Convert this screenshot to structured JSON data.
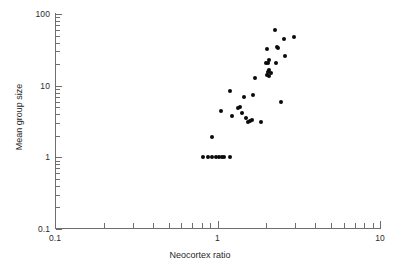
{
  "figure": {
    "background_color": "#ffffff",
    "point_color": "#0a0a0a",
    "axis_color": "#6e6e6e"
  },
  "chart_data": {
    "type": "scatter",
    "title": "",
    "xlabel": "Neocortex ratio",
    "ylabel": "Mean group size",
    "xscale": "log",
    "yscale": "log",
    "xlim": [
      0.1,
      10
    ],
    "ylim": [
      0.1,
      100
    ],
    "grid": false,
    "legend": null,
    "x_major_ticks": [
      0.1,
      1,
      10
    ],
    "x_major_tick_labels": [
      "0.1",
      "1",
      "10"
    ],
    "y_major_ticks": [
      0.1,
      1,
      10,
      100
    ],
    "y_major_tick_labels": [
      "0.1",
      "1",
      "10",
      "100"
    ],
    "x_minor_ticks": [
      0.2,
      0.3,
      0.4,
      0.5,
      0.6,
      0.7,
      0.8,
      0.9,
      2,
      3,
      4,
      5,
      6,
      7,
      8,
      9
    ],
    "y_minor_ticks": [
      0.2,
      0.3,
      0.4,
      0.5,
      0.6,
      0.7,
      0.8,
      0.9,
      2,
      3,
      4,
      5,
      6,
      7,
      8,
      9,
      20,
      30,
      40,
      50,
      60,
      70,
      80,
      90
    ],
    "marker": "filled-circle",
    "marker_size_px": 4,
    "n_points": 40,
    "points": [
      {
        "x": 0.82,
        "y": 1.0
      },
      {
        "x": 0.87,
        "y": 1.0
      },
      {
        "x": 0.93,
        "y": 1.0
      },
      {
        "x": 0.98,
        "y": 1.0
      },
      {
        "x": 1.02,
        "y": 1.0
      },
      {
        "x": 1.06,
        "y": 1.0
      },
      {
        "x": 1.09,
        "y": 1.0
      },
      {
        "x": 1.2,
        "y": 1.0
      },
      {
        "x": 0.93,
        "y": 1.95
      },
      {
        "x": 1.05,
        "y": 4.4
      },
      {
        "x": 1.2,
        "y": 8.5
      },
      {
        "x": 1.22,
        "y": 3.8
      },
      {
        "x": 1.38,
        "y": 5.1
      },
      {
        "x": 1.42,
        "y": 4.1
      },
      {
        "x": 1.45,
        "y": 7.0
      },
      {
        "x": 1.5,
        "y": 3.5
      },
      {
        "x": 1.53,
        "y": 3.1
      },
      {
        "x": 1.62,
        "y": 3.35
      },
      {
        "x": 1.66,
        "y": 7.3
      },
      {
        "x": 1.7,
        "y": 12.7
      },
      {
        "x": 1.85,
        "y": 3.1
      },
      {
        "x": 2.0,
        "y": 20.5
      },
      {
        "x": 2.02,
        "y": 14.0
      },
      {
        "x": 2.05,
        "y": 15.5
      },
      {
        "x": 2.07,
        "y": 13.5
      },
      {
        "x": 2.06,
        "y": 22.5
      },
      {
        "x": 2.03,
        "y": 33.0
      },
      {
        "x": 2.25,
        "y": 60.0
      },
      {
        "x": 2.3,
        "y": 20.5
      },
      {
        "x": 2.32,
        "y": 35.0
      },
      {
        "x": 2.45,
        "y": 6.0
      },
      {
        "x": 2.55,
        "y": 45.0
      },
      {
        "x": 2.6,
        "y": 26.0
      },
      {
        "x": 2.95,
        "y": 48.0
      },
      {
        "x": 2.12,
        "y": 14.8
      },
      {
        "x": 1.33,
        "y": 4.95
      },
      {
        "x": 1.58,
        "y": 3.2
      },
      {
        "x": 2.08,
        "y": 16.5
      },
      {
        "x": 2.04,
        "y": 21.0
      },
      {
        "x": 2.36,
        "y": 33.5
      }
    ]
  }
}
